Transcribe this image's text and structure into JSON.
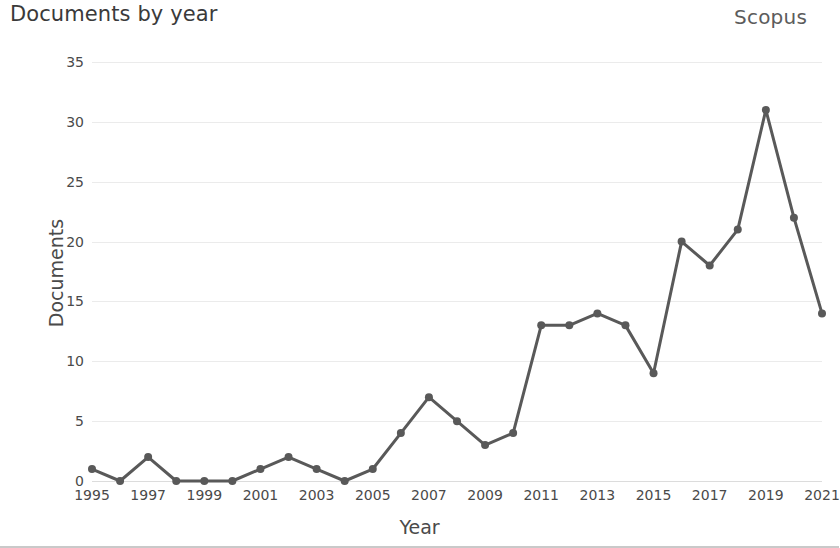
{
  "header": {
    "title": "Documents by year",
    "brand": "Scopus"
  },
  "chart_data": {
    "type": "line",
    "title": "Documents by year",
    "xlabel": "Year",
    "ylabel": "Documents",
    "x": [
      1995,
      1996,
      1997,
      1998,
      1999,
      2000,
      2001,
      2002,
      2003,
      2004,
      2005,
      2006,
      2007,
      2008,
      2009,
      2010,
      2011,
      2012,
      2013,
      2014,
      2015,
      2016,
      2017,
      2018,
      2019,
      2020,
      2021
    ],
    "values": [
      1,
      0,
      2,
      0,
      0,
      0,
      1,
      2,
      1,
      0,
      1,
      4,
      7,
      5,
      3,
      4,
      13,
      13,
      14,
      13,
      9,
      20,
      18,
      21,
      31,
      22,
      14
    ],
    "xlim": [
      1995,
      2021
    ],
    "ylim": [
      0,
      35
    ],
    "yticks": [
      0,
      5,
      10,
      15,
      20,
      25,
      30,
      35
    ],
    "xticks": [
      1995,
      1997,
      1999,
      2001,
      2003,
      2005,
      2007,
      2009,
      2011,
      2013,
      2015,
      2017,
      2019,
      2021
    ],
    "grid": true,
    "legend": false,
    "series_color": "#595959",
    "marker": "circle",
    "marker_size": 7,
    "line_width": 3
  }
}
